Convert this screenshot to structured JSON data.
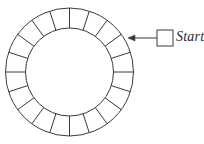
{
  "figure": {
    "type": "annulus-sector-diagram",
    "background_color": "#ffffff",
    "stroke_color": "#3a3a3a",
    "stroke_width": 1,
    "ring": {
      "center_x": 69.5,
      "center_y": 72,
      "outer_radius": 64,
      "inner_radius": 44,
      "sector_count": 20,
      "start_angle_deg": -90,
      "sector_angle_deg": 18,
      "fill": "none"
    },
    "pointer": {
      "arrow_tip_x": 128,
      "arrow_tip_y": 38,
      "arrow_tail_x": 157,
      "arrow_tail_y": 38,
      "arrow_head_length": 7,
      "arrow_head_width": 6,
      "target_description": "top-right sector of ring"
    },
    "legend_swatch": {
      "x": 157,
      "y": 30,
      "width": 16,
      "height": 16,
      "fill": "none",
      "stroke_color": "#3a3a3a"
    }
  },
  "labels": {
    "start": "Start"
  }
}
